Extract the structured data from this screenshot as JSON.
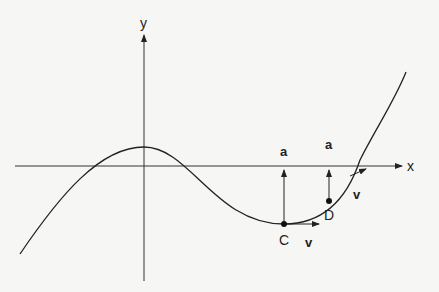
{
  "diagram": {
    "axes": {
      "x_label": "x",
      "y_label": "y"
    },
    "points": [
      {
        "id": "C",
        "label": "C",
        "velocity_label": "v",
        "acceleration_label": "a"
      },
      {
        "id": "D",
        "label": "D",
        "velocity_label": "v",
        "acceleration_label": "a"
      }
    ],
    "colors": {
      "line": "#222222",
      "background": "#f6f6f4"
    }
  }
}
